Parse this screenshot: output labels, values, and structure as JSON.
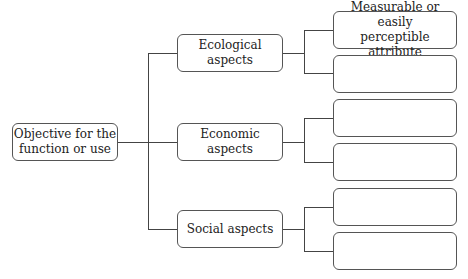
{
  "root": {
    "label": "Objective for the function or use",
    "line1": "Objective for the",
    "line2": "function or use"
  },
  "aspects": [
    {
      "label": "Ecological aspects"
    },
    {
      "label": "Economic aspects"
    },
    {
      "label": "Social aspects"
    }
  ],
  "attributes": [
    {
      "line1": "Measurable or easily",
      "line2": "perceptible attribute"
    },
    {
      "line1": "",
      "line2": ""
    },
    {
      "line1": "",
      "line2": ""
    },
    {
      "line1": "",
      "line2": ""
    },
    {
      "line1": "",
      "line2": ""
    },
    {
      "line1": "",
      "line2": ""
    }
  ],
  "colors": {
    "line": "#444444",
    "border": "#555555",
    "background": "#ffffff"
  }
}
